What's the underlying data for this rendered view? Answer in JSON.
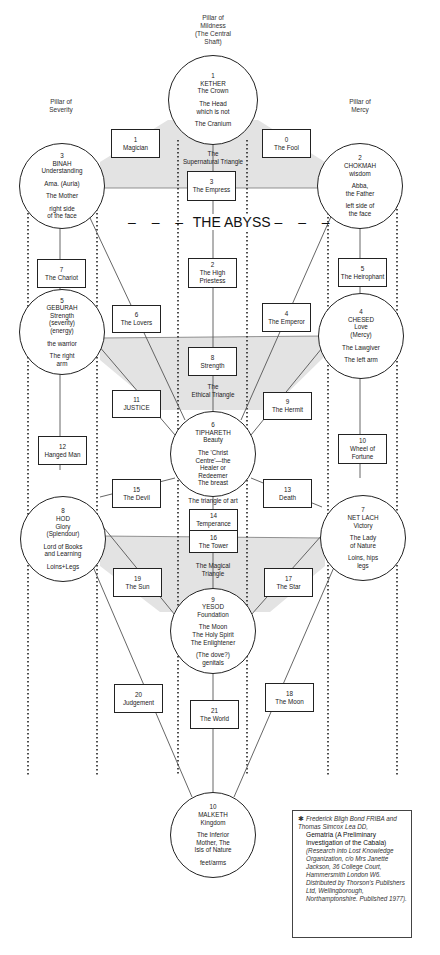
{
  "pillars": {
    "mildness": "Pillar of Mildness (The Central Shaft)",
    "mildness_lines": [
      "Pillar of",
      "Mildness",
      "(The Central",
      "Shaft)"
    ],
    "severity_lines": [
      "Pillar of",
      "Severity"
    ],
    "mercy_lines": [
      "Pillar of",
      "Mercy"
    ]
  },
  "abyss": "- - -  THE ABYSS  - - -",
  "triangles": {
    "supernatural": [
      "The",
      "Supernatural Triangle"
    ],
    "ethical": [
      "The",
      "Ethical Triangle"
    ],
    "art": [
      "The triangle of art"
    ],
    "magical": [
      "The Magical",
      "Triangle"
    ]
  },
  "sephiroth": [
    {
      "num": "1",
      "name": "KETHER",
      "lines": [
        "The Crown",
        "",
        "The Head",
        "which is not",
        "",
        "The Cranium"
      ]
    },
    {
      "num": "2",
      "name": "CHOKMAH",
      "lines": [
        "wisdom",
        "",
        "Abba,",
        "the Father",
        "",
        "left side of",
        "the face"
      ]
    },
    {
      "num": "3",
      "name": "BINAH",
      "lines": [
        "Understanding",
        "",
        "Ama. (Auria)",
        "",
        "The Mother",
        "",
        "right side",
        "of the face"
      ]
    },
    {
      "num": "4",
      "name": "CHESED",
      "lines": [
        "Love",
        "(Mercy)",
        "",
        "The Lawgiver",
        "",
        "The left arm"
      ]
    },
    {
      "num": "5",
      "name": "GEBURAH",
      "lines": [
        "Strength",
        "(severity)",
        "(energy)",
        "",
        "the warrior",
        "",
        "The right",
        "arm"
      ]
    },
    {
      "num": "6",
      "name": "TIPHARETH",
      "lines": [
        "Beauty",
        "",
        "The 'Christ",
        "Centre'—the",
        "Healer or",
        "Redeemer",
        "The breast"
      ]
    },
    {
      "num": "7",
      "name": "NET LACH",
      "lines": [
        "Victory",
        "",
        "The Lady",
        "of Nature",
        "",
        "Loins, hips",
        "legs"
      ]
    },
    {
      "num": "8",
      "name": "HOD",
      "lines": [
        "Glory",
        "(Splendour)",
        "",
        "Lord of Books",
        "and Learning",
        "",
        "Loins+Legs"
      ]
    },
    {
      "num": "9",
      "name": "YESOD",
      "lines": [
        "Foundation",
        "",
        "The Moon",
        "The Holy Spirit",
        "The Enlightener",
        "",
        "(The dove?)",
        "genitals"
      ]
    },
    {
      "num": "10",
      "name": "MALKETH",
      "lines": [
        "Kingdom",
        "",
        "The Inferior",
        "Mother, The",
        "Isis of Nature",
        "",
        "feet/arms"
      ]
    }
  ],
  "paths": [
    {
      "num": "0",
      "name": "The Fool"
    },
    {
      "num": "1",
      "name": "Magician"
    },
    {
      "num": "2",
      "name": "The High Priestess"
    },
    {
      "num": "3",
      "name": "The Empress"
    },
    {
      "num": "4",
      "name": "The Emperor"
    },
    {
      "num": "5",
      "name": "The Heirophant"
    },
    {
      "num": "6",
      "name": "The Lovers"
    },
    {
      "num": "7",
      "name": "The Chariot"
    },
    {
      "num": "8",
      "name": "Strength"
    },
    {
      "num": "9",
      "name": "The Hermit"
    },
    {
      "num": "10",
      "name": "Wheel of Fortune"
    },
    {
      "num": "11",
      "name": "JUSTICE"
    },
    {
      "num": "12",
      "name": "Hanged Man"
    },
    {
      "num": "13",
      "name": "Death"
    },
    {
      "num": "14",
      "name": "Temperance"
    },
    {
      "num": "15",
      "name": "The Devil"
    },
    {
      "num": "16",
      "name": "The Tower"
    },
    {
      "num": "17",
      "name": "The Star"
    },
    {
      "num": "18",
      "name": "The Moon"
    },
    {
      "num": "19",
      "name": "The Sun"
    },
    {
      "num": "20",
      "name": "Judgement"
    },
    {
      "num": "21",
      "name": "The World"
    }
  ],
  "footnote": {
    "star": "✱",
    "authors": "Frederick Bligh Bond FRIBA and Thomas Simcox Lea DD,",
    "title": "Gematria (A Preliminary Investigation of the Cabala)",
    "details": "(Research into Lost Knowledge Organization, c/o Mrs Janette Jackson, 36 College Court, Hammersmith London W6. Distributed by Thorson's Publishers Ltd, Wellingborough, Northamptonshire. Published 1977)."
  },
  "colors": {
    "shade": "#e3e3e3",
    "line": "#555555",
    "ink": "#222222"
  }
}
